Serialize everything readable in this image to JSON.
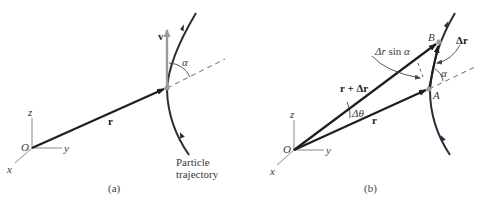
{
  "panel_a": {
    "caption": "(a)",
    "origin_label": "O",
    "axis_x": "x",
    "axis_y": "y",
    "axis_z": "z",
    "position_vector": "r",
    "velocity_vector": "v",
    "angle_label": "α",
    "trajectory_label_line1": "Particle",
    "trajectory_label_line2": "trajectory"
  },
  "panel_b": {
    "caption": "(b)",
    "origin_label": "O",
    "axis_x": "x",
    "axis_y": "y",
    "axis_z": "z",
    "vector_r": "r",
    "vector_r_plus_dr": "r + Δr",
    "vector_dr": "Δr",
    "delta_theta": "Δθ",
    "dr_sin_alpha_prefix": "Δr",
    "dr_sin_alpha_suffix": " sin ",
    "dr_sin_alpha_alpha": "α",
    "angle_label": "α",
    "point_a": "A",
    "point_b": "B"
  },
  "colors": {
    "vector": "#1f1f1f",
    "trajectory": "#2b2b3a",
    "velocity": "#9a9a9a",
    "axis": "#8a8a8a",
    "dashed": "#6a6a6a",
    "point": "#9a9a9a"
  }
}
